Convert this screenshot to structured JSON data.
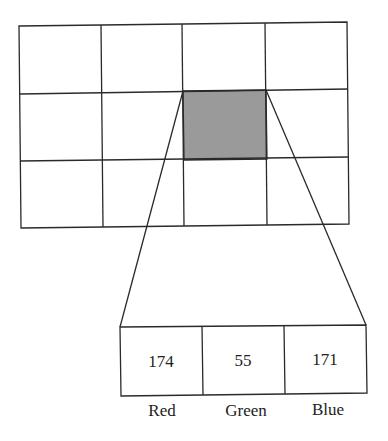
{
  "diagram": {
    "grid": {
      "rows": 3,
      "cols": 4,
      "highlighted_cell": {
        "row": 1,
        "col": 2
      },
      "highlight_color": "#999999"
    },
    "pixel": {
      "channels": [
        {
          "name": "Red",
          "value": "174"
        },
        {
          "name": "Green",
          "value": "55"
        },
        {
          "name": "Blue",
          "value": "171"
        }
      ]
    }
  }
}
